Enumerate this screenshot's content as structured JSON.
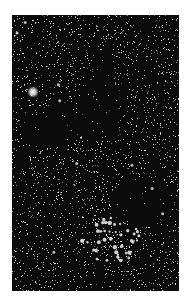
{
  "image": {
    "subject": "star field with dark nebula and open star cluster",
    "background_color": "#ffffff",
    "sky_color": "#0b0b0b",
    "frame": {
      "x": 12,
      "y": 15,
      "width": 167,
      "height": 276
    }
  },
  "features": {
    "bright_star": {
      "x": 21,
      "y": 77,
      "radius": 6
    },
    "dark_nebula": [
      {
        "x": 92,
        "y": 60,
        "rx": 10,
        "ry": 22
      },
      {
        "x": 80,
        "y": 100,
        "rx": 28,
        "ry": 22
      },
      {
        "x": 40,
        "y": 115,
        "rx": 30,
        "ry": 18
      },
      {
        "x": 130,
        "y": 185,
        "rx": 30,
        "ry": 25
      }
    ],
    "star_cluster": {
      "x": 100,
      "y": 225,
      "rx": 30,
      "ry": 22
    },
    "star_count": 2600
  }
}
